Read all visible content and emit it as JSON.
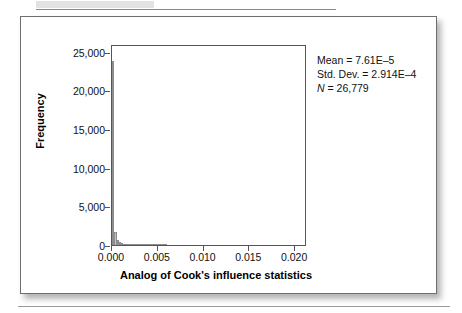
{
  "chart_data": {
    "type": "bar",
    "title": "",
    "subtitle": "",
    "xlabel": "Analog of Cook's influence statistics",
    "ylabel": "Frequency",
    "xlim": [
      0.0,
      0.0213
    ],
    "ylim": [
      0,
      26000
    ],
    "grid": false,
    "legend": null,
    "xticks": [
      "0.000",
      "0.005",
      "0.010",
      "0.015",
      "0.020"
    ],
    "xtick_values": [
      0.0,
      0.005,
      0.01,
      0.015,
      0.02
    ],
    "yticks": [
      "0",
      "5,000",
      "10,000",
      "15,000",
      "20,000",
      "25,000"
    ],
    "ytick_values": [
      0,
      5000,
      10000,
      15000,
      20000,
      25000
    ],
    "bin_width": 0.00025,
    "x": [
      0.000125,
      0.000375,
      0.000625,
      0.000875,
      0.001125,
      0.001375,
      0.001625,
      0.001875,
      0.002125,
      0.002375,
      0.002625,
      0.002875,
      0.003125,
      0.003375,
      0.003625,
      0.003875,
      0.004125,
      0.004375,
      0.004625,
      0.004875,
      0.005125,
      0.005375,
      0.005625,
      0.005875
    ],
    "values": [
      23800,
      1650,
      620,
      330,
      210,
      150,
      110,
      85,
      70,
      58,
      48,
      40,
      34,
      28,
      24,
      20,
      17,
      14,
      12,
      10,
      8,
      7,
      5,
      4
    ],
    "annotations": [
      "Mean = 7.61E–5",
      "Std. Dev. = 2.914E–4",
      "N = 26,779"
    ]
  },
  "figure": {
    "stats": {
      "mean_label": "Mean = 7.61E–5",
      "stddev_label": "Std. Dev. = 2.914E–4",
      "n_symbol": "N",
      "n_value": " = 26,779"
    }
  },
  "colors": {
    "bar_fill": "#c2c2c2",
    "bar_outline": "#8d8d8d",
    "axis": "#555555",
    "text": "#111111",
    "card_border": "#6e6e6e",
    "background": "#ffffff"
  }
}
